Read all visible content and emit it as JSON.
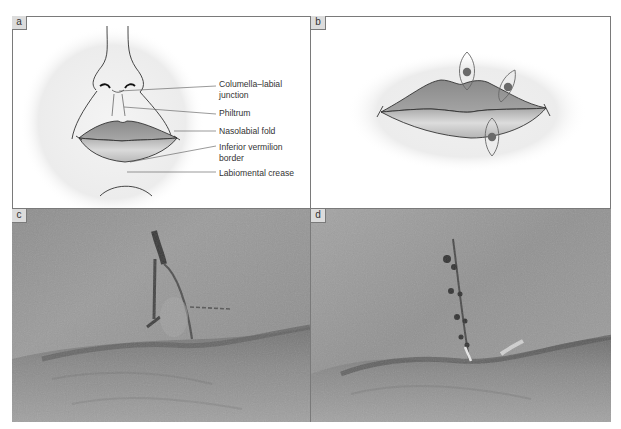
{
  "figure": {
    "panels": [
      {
        "id": "a",
        "label": "a",
        "type": "diagram",
        "description": "Frontal line drawing of nose, lips and chin with anatomical labels"
      },
      {
        "id": "b",
        "label": "b",
        "type": "diagram",
        "description": "Lips with three elliptical excision markings"
      },
      {
        "id": "c",
        "label": "c",
        "type": "photo",
        "description": "Close-up of lip with surgical ink marking of excision"
      },
      {
        "id": "d",
        "label": "d",
        "type": "photo",
        "description": "Close-up of lip after sutured closure"
      }
    ],
    "annotations": {
      "columella": "Columella–labial junction",
      "columella_line1": "Columella–labial",
      "columella_line2": "junction",
      "philtrum": "Philtrum",
      "nasolabial": "Nasolabial fold",
      "vermilion_line1": "Inferior vermilion",
      "vermilion_line2": "border",
      "labiomental": "Labiomental crease"
    },
    "colors": {
      "border": "#7a7a7a",
      "label_bg": "#dcdcdc",
      "lip_upper": "#8e8e8e",
      "lip_lower": "#c4c4c4",
      "halo": "#ececec",
      "dot": "#6a6a6a"
    }
  }
}
